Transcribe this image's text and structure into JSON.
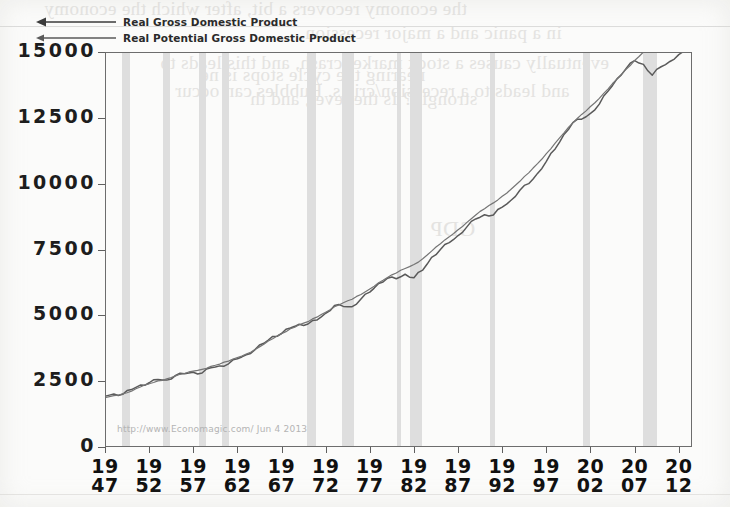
{
  "chart_data": {
    "type": "line",
    "title": "",
    "subtitle": "",
    "xlabel": "",
    "ylabel": "",
    "xlim": [
      1947,
      2013.5
    ],
    "ylim": [
      0,
      15000
    ],
    "grid": false,
    "legend_position": "top-left",
    "source_watermark": "http://www.Economagic.com/   Jun 4 2013",
    "y_ticks": [
      "0",
      "2500",
      "5000",
      "7500",
      "10000",
      "12500",
      "15000"
    ],
    "y_tick_values": [
      0,
      2500,
      5000,
      7500,
      10000,
      12500,
      15000
    ],
    "x_ticks": [
      {
        "top": "19",
        "bottom": "47",
        "year": 1947
      },
      {
        "top": "19",
        "bottom": "52",
        "year": 1952
      },
      {
        "top": "19",
        "bottom": "57",
        "year": 1957
      },
      {
        "top": "19",
        "bottom": "62",
        "year": 1962
      },
      {
        "top": "19",
        "bottom": "67",
        "year": 1967
      },
      {
        "top": "19",
        "bottom": "72",
        "year": 1972
      },
      {
        "top": "19",
        "bottom": "77",
        "year": 1977
      },
      {
        "top": "19",
        "bottom": "82",
        "year": 1982
      },
      {
        "top": "19",
        "bottom": "87",
        "year": 1987
      },
      {
        "top": "19",
        "bottom": "92",
        "year": 1992
      },
      {
        "top": "19",
        "bottom": "97",
        "year": 1997
      },
      {
        "top": "20",
        "bottom": "02",
        "year": 2002
      },
      {
        "top": "20",
        "bottom": "07",
        "year": 2007
      },
      {
        "top": "20",
        "bottom": "12",
        "year": 2012
      }
    ],
    "series": [
      {
        "name": "Real Gross Domestic Product",
        "color": "#5a5a5a",
        "x": [
          1947,
          1948,
          1949,
          1950,
          1951,
          1952,
          1953,
          1954,
          1955,
          1956,
          1957,
          1958,
          1959,
          1960,
          1961,
          1962,
          1963,
          1964,
          1965,
          1966,
          1967,
          1968,
          1969,
          1970,
          1971,
          1972,
          1973,
          1974,
          1975,
          1976,
          1977,
          1978,
          1979,
          1980,
          1981,
          1982,
          1983,
          1984,
          1985,
          1986,
          1987,
          1988,
          1989,
          1990,
          1991,
          1992,
          1993,
          1994,
          1995,
          1996,
          1997,
          1998,
          1999,
          2000,
          2001,
          2002,
          2003,
          2004,
          2005,
          2006,
          2007,
          2008,
          2009,
          2010,
          2011,
          2012,
          2013
        ],
        "values": [
          1930,
          2010,
          2000,
          2180,
          2350,
          2440,
          2560,
          2540,
          2720,
          2780,
          2840,
          2810,
          3010,
          3080,
          3160,
          3350,
          3500,
          3700,
          3940,
          4200,
          4310,
          4520,
          4660,
          4670,
          4820,
          5080,
          5370,
          5340,
          5330,
          5620,
          5880,
          6210,
          6410,
          6390,
          6560,
          6430,
          6720,
          7200,
          7500,
          7760,
          8030,
          8360,
          8660,
          8820,
          8810,
          9110,
          9370,
          9750,
          10000,
          10390,
          10850,
          11320,
          11870,
          12320,
          12450,
          12670,
          13020,
          13520,
          13980,
          14360,
          14670,
          14530,
          14120,
          14440,
          14640,
          14900,
          15000
        ],
        "note": "Actual real GDP, billions of chained dollars"
      },
      {
        "name": "Real Potential Gross Domestic Product",
        "color": "#757575",
        "x": [
          1947,
          1948,
          1949,
          1950,
          1951,
          1952,
          1953,
          1954,
          1955,
          1956,
          1957,
          1958,
          1959,
          1960,
          1961,
          1962,
          1963,
          1964,
          1965,
          1966,
          1967,
          1968,
          1969,
          1970,
          1971,
          1972,
          1973,
          1974,
          1975,
          1976,
          1977,
          1978,
          1979,
          1980,
          1981,
          1982,
          1983,
          1984,
          1985,
          1986,
          1987,
          1988,
          1989,
          1990,
          1991,
          1992,
          1993,
          1994,
          1995,
          1996,
          1997,
          1998,
          1999,
          2000,
          2001,
          2002,
          2003,
          2004,
          2005,
          2006,
          2007,
          2008,
          2009,
          2010,
          2011,
          2012,
          2013
        ],
        "values": [
          1870,
          1950,
          2020,
          2120,
          2280,
          2400,
          2510,
          2590,
          2700,
          2790,
          2880,
          2950,
          3060,
          3150,
          3260,
          3400,
          3530,
          3700,
          3900,
          4110,
          4300,
          4490,
          4640,
          4760,
          4930,
          5120,
          5330,
          5480,
          5610,
          5790,
          6000,
          6240,
          6440,
          6610,
          6780,
          6930,
          7150,
          7440,
          7720,
          7980,
          8250,
          8530,
          8810,
          9050,
          9270,
          9520,
          9790,
          10090,
          10410,
          10760,
          11140,
          11540,
          11930,
          12310,
          12630,
          12930,
          13240,
          13600,
          13970,
          14330,
          14680,
          15000,
          15280,
          15550,
          15870,
          16200,
          16500
        ],
        "note": "CBO estimate of real potential GDP"
      }
    ],
    "recessions": [
      {
        "label": "1948-49",
        "start": 1948.9,
        "end": 1949.8
      },
      {
        "label": "1953-54",
        "start": 1953.6,
        "end": 1954.4
      },
      {
        "label": "1957-58",
        "start": 1957.7,
        "end": 1958.4
      },
      {
        "label": "1960-61",
        "start": 1960.3,
        "end": 1961.1
      },
      {
        "label": "1969-70",
        "start": 1969.9,
        "end": 1970.9
      },
      {
        "label": "1973-75",
        "start": 1973.9,
        "end": 1975.2
      },
      {
        "label": "1980",
        "start": 1980.1,
        "end": 1980.5
      },
      {
        "label": "1981-82",
        "start": 1981.6,
        "end": 1982.9
      },
      {
        "label": "1990-91",
        "start": 1990.6,
        "end": 1991.2
      },
      {
        "label": "2001",
        "start": 2001.2,
        "end": 2001.9
      },
      {
        "label": "2007-09",
        "start": 2007.9,
        "end": 2009.5
      }
    ]
  },
  "legend": {
    "items": [
      {
        "label": "Real Gross Domestic Product"
      },
      {
        "label": "Real Potential Gross Domestic Product"
      }
    ]
  },
  "bleed_through": {
    "lines": [
      "the economy recovers a bit, after which the economy",
      "in a panic and a major recession.",
      "eventually causes a stock market crash, and this leads to",
      "and leads to a recession/crisis. Bubbles can occur",
      "GDP",
      "nearing the cycle stops is ne",
      "strongly? Is the level, and th"
    ]
  }
}
